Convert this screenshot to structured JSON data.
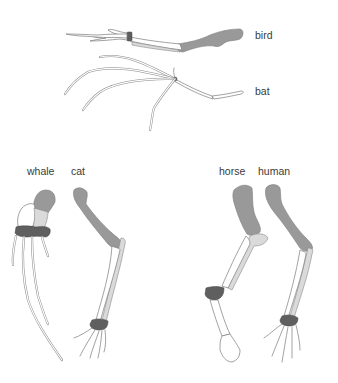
{
  "figure": {
    "colors": {
      "humerus": "#999999",
      "radius": "#dadada",
      "ulna": "#ffffff",
      "carpals": "#5f5f5f",
      "outline": "#7a7a7a",
      "label_text": "#3a3a3a"
    },
    "labels": {
      "bird": "bird",
      "bat": "bat",
      "whale": "whale",
      "cat": "cat",
      "horse": "horse",
      "human": "human"
    },
    "legend_of_shading": [
      {
        "part": "humerus",
        "shade": "dark gray"
      },
      {
        "part": "radius",
        "shade": "light gray"
      },
      {
        "part": "ulna",
        "shade": "white"
      },
      {
        "part": "carpals",
        "shade": "darkest gray"
      }
    ]
  }
}
